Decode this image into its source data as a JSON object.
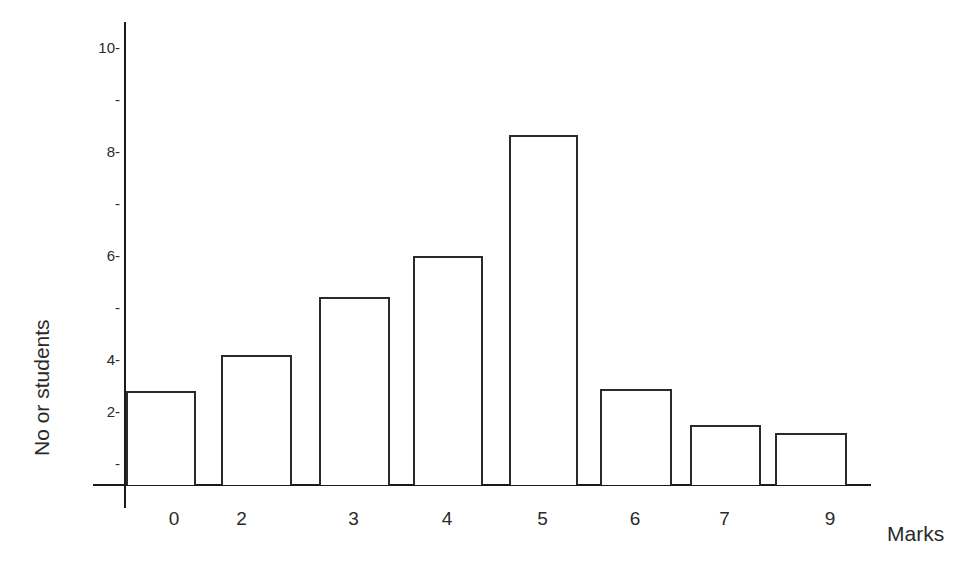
{
  "chart_data": {
    "type": "bar",
    "title": "",
    "xlabel": "Marks",
    "ylabel": "No or students",
    "categories": [
      "0",
      "2",
      "3",
      "4",
      "5",
      "6",
      "7",
      "9"
    ],
    "values": [
      2.8,
      4.1,
      5.2,
      6.0,
      8.3,
      2.9,
      1.5,
      1.2
    ],
    "ytick_labels": [
      "10-",
      "-",
      "8-",
      "-",
      "6-",
      "-",
      "4-",
      "2-",
      "-"
    ],
    "ylim": [
      0,
      10
    ],
    "grid": false,
    "legend": null,
    "bar_style": "outlined, white fill"
  },
  "colors": {
    "line": "#2a2a2a",
    "background": "#ffffff"
  }
}
